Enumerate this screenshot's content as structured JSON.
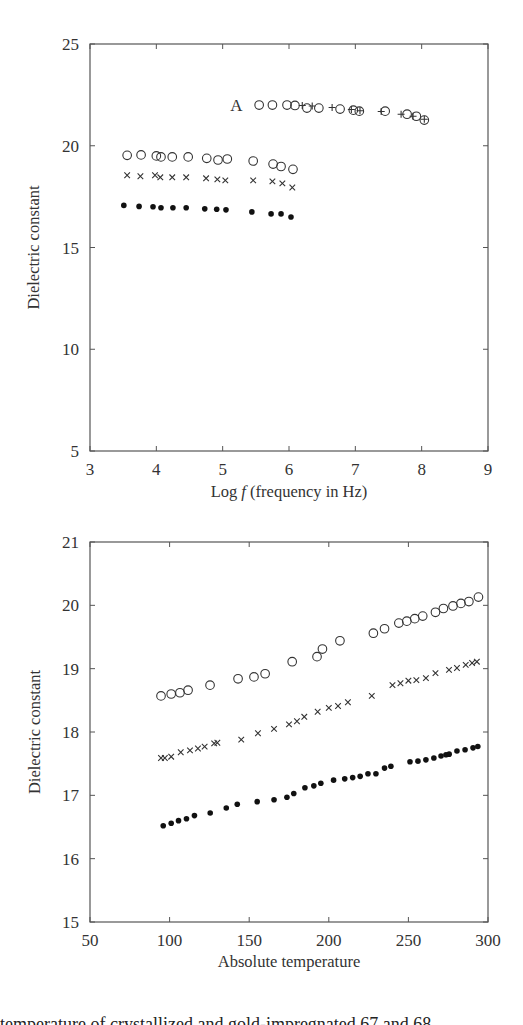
{
  "chart_data": [
    {
      "type": "scatter",
      "title": "",
      "xlabel": "Log f (frequency in Hz)",
      "xlabel_prefix": "Log ",
      "xlabel_italic": "f",
      "xlabel_suffix": " (frequency in Hz)",
      "ylabel": "Dielectric constant",
      "xlim": [
        3,
        9
      ],
      "ylim": [
        5,
        25
      ],
      "xticks": [
        3,
        4,
        5,
        6,
        7,
        8,
        9
      ],
      "yticks": [
        5,
        10,
        15,
        20,
        25
      ],
      "grid": false,
      "annotations": [
        {
          "text": "A",
          "x": 5.3,
          "y": 22.0
        }
      ],
      "series": [
        {
          "name": "A (open circles)",
          "marker": "circle-open",
          "x": [
            5.55,
            5.75,
            5.97,
            6.09,
            6.27,
            6.45,
            6.77,
            6.97,
            7.06,
            7.45,
            7.78,
            7.92,
            8.04
          ],
          "y": [
            22.0,
            22.0,
            22.0,
            21.98,
            21.85,
            21.85,
            21.8,
            21.75,
            21.7,
            21.7,
            21.55,
            21.45,
            21.26
          ]
        },
        {
          "name": "A (plus)",
          "marker": "plus",
          "x": [
            6.2,
            6.35,
            6.65,
            6.94,
            7.07,
            7.39,
            7.69,
            7.87,
            8.04
          ],
          "y": [
            21.98,
            21.95,
            21.88,
            21.78,
            21.72,
            21.68,
            21.55,
            21.45,
            21.3
          ]
        },
        {
          "name": "open circles",
          "marker": "circle-open",
          "x": [
            3.56,
            3.77,
            4.0,
            4.07,
            4.24,
            4.48,
            4.76,
            4.93,
            5.07,
            5.46,
            5.76,
            5.88,
            6.06
          ],
          "y": [
            19.53,
            19.55,
            19.5,
            19.45,
            19.45,
            19.45,
            19.38,
            19.3,
            19.35,
            19.25,
            19.1,
            18.98,
            18.84
          ]
        },
        {
          "name": "crosses",
          "marker": "cross",
          "x": [
            3.56,
            3.76,
            3.98,
            4.06,
            4.24,
            4.45,
            4.75,
            4.92,
            5.04,
            5.46,
            5.75,
            5.9,
            6.05
          ],
          "y": [
            18.55,
            18.5,
            18.55,
            18.45,
            18.45,
            18.45,
            18.4,
            18.35,
            18.3,
            18.3,
            18.25,
            18.15,
            17.95
          ]
        },
        {
          "name": "filled dots",
          "marker": "dot",
          "x": [
            3.51,
            3.74,
            3.95,
            4.07,
            4.25,
            4.45,
            4.73,
            4.91,
            5.05,
            5.44,
            5.73,
            5.88,
            6.03
          ],
          "y": [
            17.07,
            17.02,
            17.0,
            16.95,
            16.95,
            16.95,
            16.9,
            16.88,
            16.85,
            16.75,
            16.65,
            16.65,
            16.5
          ]
        }
      ]
    },
    {
      "type": "scatter",
      "title": "",
      "xlabel": "Absolute temperature",
      "ylabel": "Dielectric constant",
      "xlim": [
        50,
        300
      ],
      "ylim": [
        15,
        21
      ],
      "xticks": [
        50,
        100,
        150,
        200,
        250,
        300
      ],
      "yticks": [
        15,
        16,
        17,
        18,
        19,
        20,
        21
      ],
      "grid": false,
      "series": [
        {
          "name": "open circles",
          "marker": "circle-open",
          "x": [
            94.6,
            101,
            106.5,
            111.6,
            125.4,
            143,
            153,
            160,
            177,
            192.6,
            196,
            207,
            228,
            235,
            244,
            249,
            254,
            259,
            267,
            272,
            278,
            283,
            288,
            294
          ],
          "y": [
            18.57,
            18.6,
            18.62,
            18.66,
            18.74,
            18.84,
            18.87,
            18.92,
            19.11,
            19.19,
            19.31,
            19.44,
            19.56,
            19.63,
            19.72,
            19.75,
            19.79,
            19.83,
            19.89,
            19.95,
            19.99,
            20.03,
            20.06,
            20.13
          ]
        },
        {
          "name": "crosses",
          "marker": "cross",
          "x": [
            94.6,
            97,
            101,
            107,
            112.8,
            117.8,
            122,
            128,
            130,
            145,
            155.5,
            165.6,
            175,
            180,
            184.6,
            193,
            200,
            205.8,
            212,
            227,
            240,
            245,
            250,
            255,
            261,
            267,
            275.5,
            280.5,
            286,
            290,
            293
          ],
          "y": [
            17.59,
            17.59,
            17.61,
            17.68,
            17.71,
            17.74,
            17.77,
            17.82,
            17.83,
            17.88,
            17.98,
            18.05,
            18.12,
            18.17,
            18.24,
            18.32,
            18.38,
            18.41,
            18.47,
            18.57,
            18.74,
            18.77,
            18.81,
            18.82,
            18.85,
            18.93,
            18.98,
            19.01,
            19.06,
            19.09,
            19.11
          ]
        },
        {
          "name": "filled dots",
          "marker": "dot",
          "x": [
            96,
            101,
            105.6,
            110.6,
            115.6,
            125.5,
            135.6,
            142.5,
            155,
            165.6,
            173.7,
            178,
            185,
            190.6,
            195,
            203,
            210,
            215,
            219.7,
            224.6,
            229.6,
            235,
            239,
            251,
            256,
            261,
            266,
            270.5,
            273.6,
            275.6,
            280.5,
            285.6,
            290.6,
            293.6
          ],
          "y": [
            16.52,
            16.56,
            16.6,
            16.63,
            16.68,
            16.72,
            16.8,
            16.86,
            16.9,
            16.93,
            16.97,
            17.03,
            17.12,
            17.15,
            17.19,
            17.24,
            17.26,
            17.28,
            17.3,
            17.34,
            17.34,
            17.43,
            17.46,
            17.53,
            17.54,
            17.56,
            17.59,
            17.62,
            17.64,
            17.65,
            17.7,
            17.72,
            17.75,
            17.77
          ]
        }
      ]
    }
  ],
  "caption": {
    "text": "temperature of crystallized and gold-impregnated 67 and 68"
  },
  "colors": {
    "axis": "#555555",
    "marker": "#333333",
    "text": "#333333"
  }
}
